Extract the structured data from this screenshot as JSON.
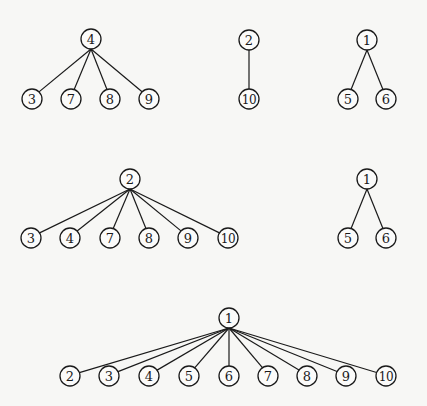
{
  "diagram": {
    "type": "forest-of-trees",
    "node_radius": 10,
    "colors": {
      "stroke": "#1a1a1a",
      "background": "#f7f7f5"
    },
    "trees": [
      {
        "id": "tree-a",
        "root": {
          "label": "4",
          "x": 91,
          "y": 39
        },
        "children": [
          {
            "label": "3",
            "x": 32,
            "y": 99
          },
          {
            "label": "7",
            "x": 71,
            "y": 99
          },
          {
            "label": "8",
            "x": 110,
            "y": 99
          },
          {
            "label": "9",
            "x": 149,
            "y": 99
          }
        ]
      },
      {
        "id": "tree-b",
        "root": {
          "label": "2",
          "x": 249,
          "y": 40
        },
        "children": [
          {
            "label": "10",
            "x": 249,
            "y": 99
          }
        ]
      },
      {
        "id": "tree-c",
        "root": {
          "label": "1",
          "x": 367,
          "y": 40
        },
        "children": [
          {
            "label": "5",
            "x": 348,
            "y": 99
          },
          {
            "label": "6",
            "x": 386,
            "y": 99
          }
        ]
      },
      {
        "id": "tree-d",
        "root": {
          "label": "2",
          "x": 130,
          "y": 179
        },
        "children": [
          {
            "label": "3",
            "x": 31,
            "y": 238
          },
          {
            "label": "4",
            "x": 70,
            "y": 238
          },
          {
            "label": "7",
            "x": 110,
            "y": 238
          },
          {
            "label": "8",
            "x": 149,
            "y": 238
          },
          {
            "label": "9",
            "x": 188,
            "y": 238
          },
          {
            "label": "10",
            "x": 228,
            "y": 238
          }
        ]
      },
      {
        "id": "tree-e",
        "root": {
          "label": "1",
          "x": 367,
          "y": 179
        },
        "children": [
          {
            "label": "5",
            "x": 348,
            "y": 238
          },
          {
            "label": "6",
            "x": 386,
            "y": 238
          }
        ]
      },
      {
        "id": "tree-f",
        "root": {
          "label": "1",
          "x": 229,
          "y": 318
        },
        "children": [
          {
            "label": "2",
            "x": 70,
            "y": 376
          },
          {
            "label": "3",
            "x": 109,
            "y": 376
          },
          {
            "label": "4",
            "x": 149,
            "y": 376
          },
          {
            "label": "5",
            "x": 189,
            "y": 376
          },
          {
            "label": "6",
            "x": 229,
            "y": 376
          },
          {
            "label": "7",
            "x": 268,
            "y": 376
          },
          {
            "label": "8",
            "x": 307,
            "y": 376
          },
          {
            "label": "9",
            "x": 346,
            "y": 376
          },
          {
            "label": "10",
            "x": 386,
            "y": 376
          }
        ]
      }
    ]
  }
}
